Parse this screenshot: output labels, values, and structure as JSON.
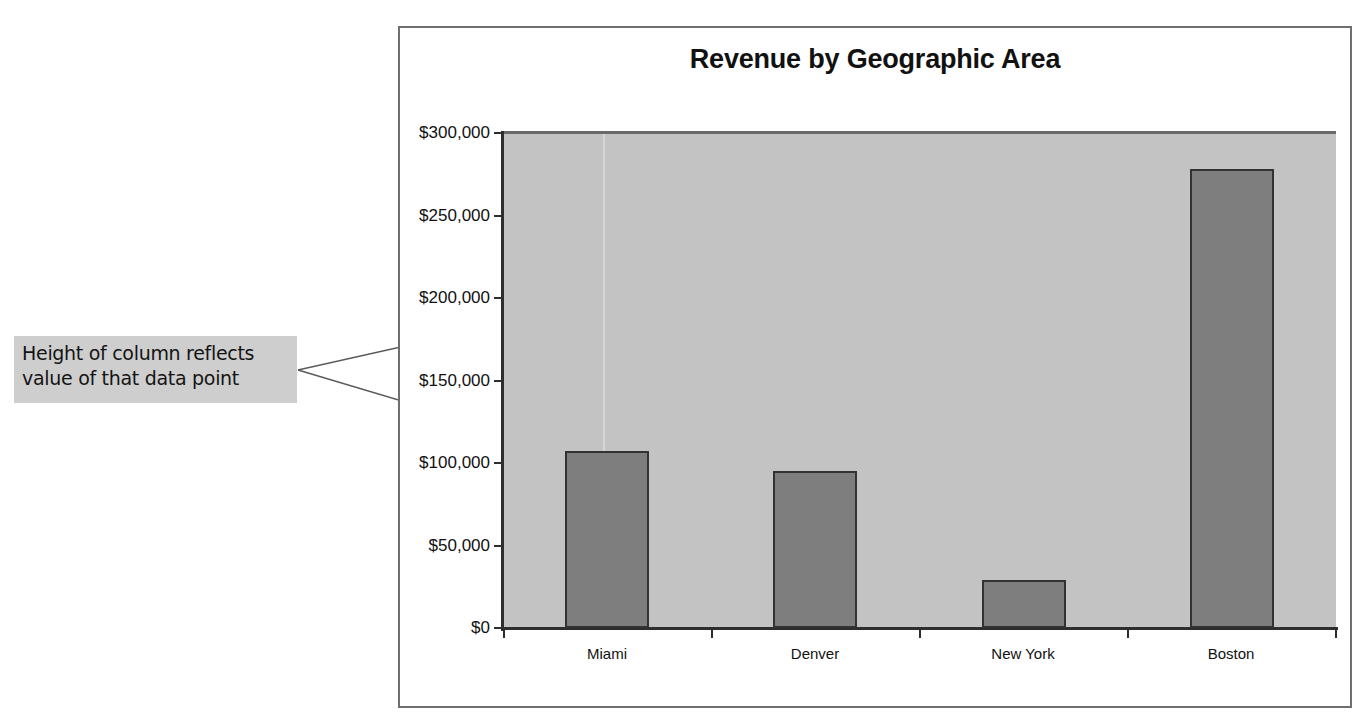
{
  "chart_data": {
    "type": "bar",
    "title": "Revenue by Geographic Area",
    "categories": [
      "Miami",
      "Denver",
      "New York",
      "Boston"
    ],
    "values": [
      107000,
      95000,
      29000,
      278000
    ],
    "xlabel": "",
    "ylabel": "",
    "ylim": [
      0,
      300000
    ],
    "ytick_labels": [
      "$300,000",
      "$250,000",
      "$200,000",
      "$150,000",
      "$100,000",
      "$50,000",
      "$0"
    ],
    "ytick_values": [
      300000,
      250000,
      200000,
      150000,
      100000,
      50000,
      0
    ],
    "grid": false,
    "legend": false,
    "legend_position": "none",
    "series": [
      {
        "name": "Revenue",
        "values": [
          107000,
          95000,
          29000,
          278000
        ]
      }
    ],
    "colors": {
      "bar_fill": "#7e7e7e",
      "bar_border": "#323232",
      "plot_background": "#c3c3c3",
      "frame_border": "#6f6f6f",
      "axis": "#2e2e2e",
      "annotation_background": "#cecece",
      "text": "#111111"
    }
  },
  "annotation": {
    "line1": "Height of column reflects",
    "line2": "value of that data point"
  }
}
